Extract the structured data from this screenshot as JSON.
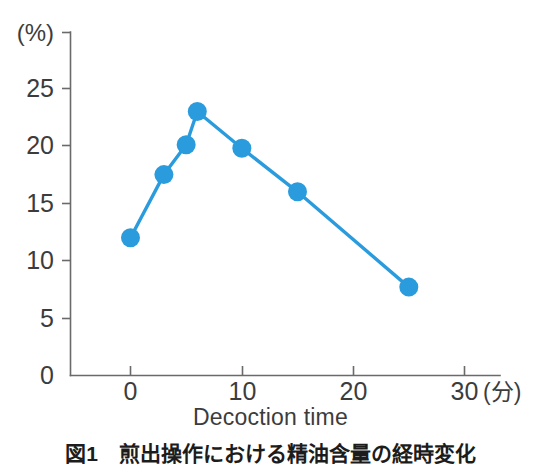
{
  "chart_data": {
    "type": "line",
    "title": "",
    "xlabel": "Decoction time",
    "ylabel": "(%)",
    "x_unit": "(分)",
    "y_unit": "(%)",
    "xlim": [
      -2.5,
      31
    ],
    "ylim": [
      0,
      27.5
    ],
    "grid": false,
    "legend": null,
    "x": [
      0,
      3,
      5,
      6,
      10,
      15,
      25
    ],
    "values": [
      12.0,
      17.5,
      20.1,
      23.0,
      19.8,
      16.0,
      7.7
    ],
    "points": [
      {
        "x": 0,
        "y": 12.0
      },
      {
        "x": 3,
        "y": 17.5
      },
      {
        "x": 5,
        "y": 20.1
      },
      {
        "x": 6,
        "y": 23.0
      },
      {
        "x": 10,
        "y": 19.8
      },
      {
        "x": 15,
        "y": 16.0
      },
      {
        "x": 25,
        "y": 7.7
      }
    ],
    "series": [
      {
        "name": "",
        "color": "#2A9BDC",
        "values": [
          12.0,
          17.5,
          20.1,
          23.0,
          19.8,
          16.0,
          7.7
        ]
      }
    ],
    "x_ticks": [
      0,
      10,
      20,
      30
    ],
    "x_tick_labels": [
      "0",
      "10",
      "20",
      "30"
    ],
    "y_ticks": [
      0,
      5,
      10,
      15,
      20,
      25
    ],
    "y_tick_labels": [
      "0",
      "5",
      "10",
      "15",
      "20",
      "25"
    ],
    "marker": "circle",
    "marker_size": 9.5
  },
  "axes": {
    "y_unit_label": "(%)",
    "x_unit_label": "(分)",
    "x_axis_title": "Decoction time"
  },
  "caption": {
    "text": "図1　煎出操作における精油含量の経時変化"
  },
  "colors": {
    "series": "#2A9BDC",
    "axis": "#6a6a6a",
    "text": "#3c3c3c"
  }
}
